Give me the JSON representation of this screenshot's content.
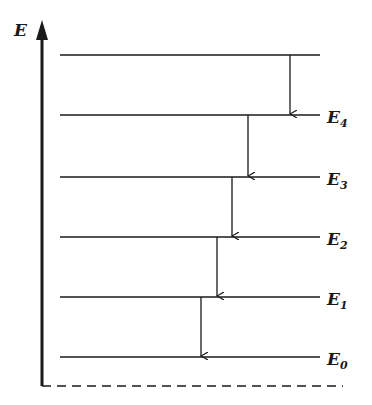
{
  "diagram": {
    "type": "energy-level-diagram",
    "axis_label": "E",
    "levels": [
      {
        "name": "top",
        "label": ""
      },
      {
        "name": "E4",
        "label": "E",
        "sub": "4"
      },
      {
        "name": "E3",
        "label": "E",
        "sub": "3"
      },
      {
        "name": "E2",
        "label": "E",
        "sub": "2"
      },
      {
        "name": "E1",
        "label": "E",
        "sub": "1"
      },
      {
        "name": "E0",
        "label": "E",
        "sub": "0"
      }
    ],
    "transitions": [
      {
        "from": "top",
        "to": "E4"
      },
      {
        "from": "E4",
        "to": "E3"
      },
      {
        "from": "E3",
        "to": "E2"
      },
      {
        "from": "E2",
        "to": "E1"
      },
      {
        "from": "E1",
        "to": "E0"
      }
    ],
    "baseline": "dashed",
    "colors": {
      "ink": "#1a1a1a",
      "background": "#ffffff"
    }
  }
}
